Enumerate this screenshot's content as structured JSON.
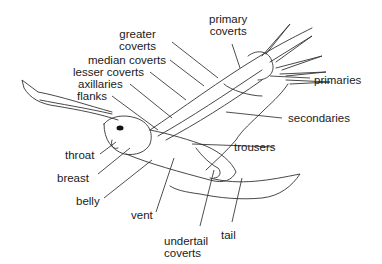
{
  "diagram": {
    "labels": {
      "primary_coverts": "primary\ncoverts",
      "greater_coverts": "greater\ncoverts",
      "median_coverts": "median coverts",
      "lesser_coverts": "lesser coverts",
      "axillaries": "axillaries",
      "flanks": "flanks",
      "primaries": "primaries",
      "secondaries": "secondaries",
      "trousers": "trousers",
      "throat": "throat",
      "breast": "breast",
      "belly": "belly",
      "vent": "vent",
      "undertail_coverts": "undertail\ncoverts",
      "tail": "tail"
    },
    "colors": {
      "line": "#333333",
      "text": "#1a1a1a",
      "background": "#ffffff"
    }
  }
}
